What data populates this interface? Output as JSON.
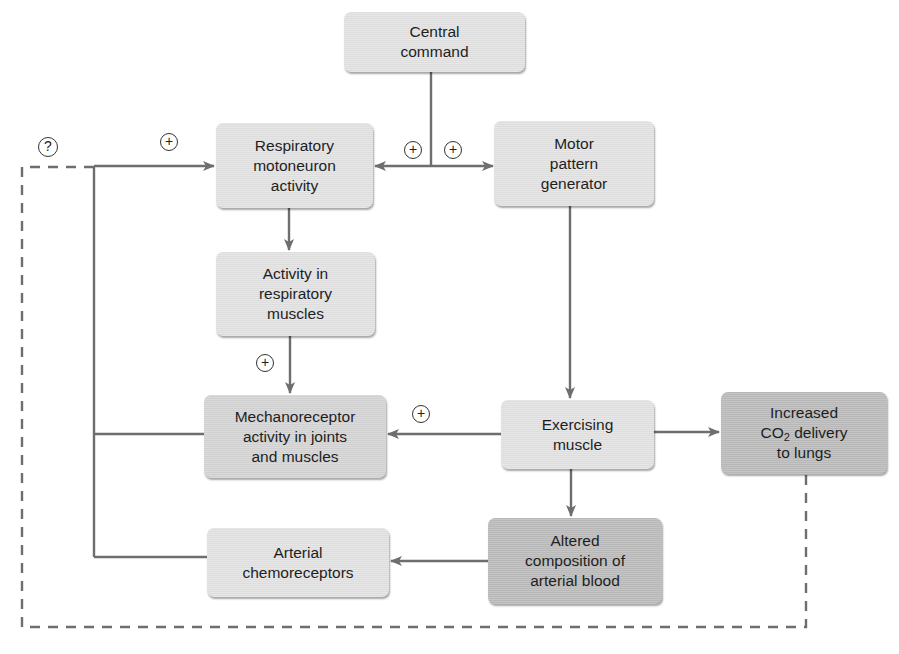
{
  "diagram": {
    "type": "flowchart",
    "topic": "Control of ventilation during exercise",
    "colors": {
      "line": "#6e6e6e",
      "dashed_line": "#6e6e6e",
      "box_light": "#e4e4e4",
      "box_medium": "#d6d6d6",
      "box_dark": "#bdbdbd"
    },
    "nodes": {
      "central_command": {
        "label": "Central\ncommand"
      },
      "resp_motoneuron": {
        "label": "Respiratory\nmotoneuron\nactivity"
      },
      "motor_pattern": {
        "label": "Motor\npattern\ngenerator"
      },
      "resp_muscles": {
        "label": "Activity in\nrespiratory\nmuscles"
      },
      "mechanoreceptor": {
        "label": "Mechanoreceptor\nactivity in joints\nand muscles"
      },
      "exercising_muscle": {
        "label": "Exercising\nmuscle"
      },
      "co2_delivery": {
        "label_pre": "Increased\nCO",
        "label_sub": "2",
        "label_post": " delivery\nto lungs"
      },
      "altered_blood": {
        "label": "Altered\ncomposition of\narterial blood"
      },
      "chemoreceptors": {
        "label": "Arterial\nchemoreceptors"
      }
    },
    "signs": {
      "question": "?",
      "plus_feedback": "+",
      "plus_central_left": "+",
      "plus_central_right": "+",
      "plus_resp_muscles": "+",
      "plus_exercising": "+"
    },
    "edges": [
      {
        "from": "central_command",
        "to": "resp_motoneuron",
        "sign": "+"
      },
      {
        "from": "central_command",
        "to": "motor_pattern",
        "sign": "+"
      },
      {
        "from": "resp_motoneuron",
        "to": "resp_muscles"
      },
      {
        "from": "resp_muscles",
        "to": "mechanoreceptor",
        "sign": "+"
      },
      {
        "from": "motor_pattern",
        "to": "exercising_muscle"
      },
      {
        "from": "exercising_muscle",
        "to": "mechanoreceptor",
        "sign": "+"
      },
      {
        "from": "exercising_muscle",
        "to": "co2_delivery"
      },
      {
        "from": "exercising_muscle",
        "to": "altered_blood"
      },
      {
        "from": "altered_blood",
        "to": "chemoreceptors"
      },
      {
        "from": "mechanoreceptor",
        "to": "resp_motoneuron",
        "sign": "+",
        "via": "feedback bus"
      },
      {
        "from": "chemoreceptors",
        "to": "resp_motoneuron",
        "sign": "+",
        "via": "feedback bus"
      },
      {
        "from": "co2_delivery",
        "to": "resp_motoneuron",
        "sign": "?",
        "style": "dashed"
      }
    ]
  }
}
